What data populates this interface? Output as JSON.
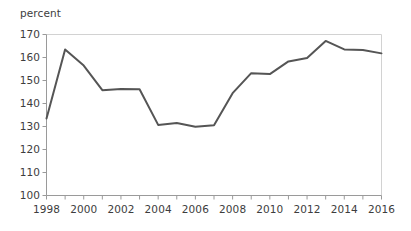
{
  "chart_data": {
    "type": "line",
    "title": "",
    "subtitle": "",
    "xlabel": "",
    "ylabel": "percent",
    "unit_label": "percent",
    "x": [
      1998,
      1999,
      2000,
      2001,
      2002,
      2003,
      2004,
      2005,
      2006,
      2007,
      2008,
      2009,
      2010,
      2011,
      2012,
      2013,
      2014,
      2015,
      2016
    ],
    "values": [
      133.5,
      163.5,
      156.5,
      145.8,
      146.3,
      146.2,
      130.7,
      131.5,
      129.9,
      130.5,
      144.5,
      153.2,
      152.8,
      158.3,
      159.8,
      167.2,
      163.5,
      163.3,
      161.8
    ],
    "series": [
      {
        "name": "percent",
        "values": [
          133.5,
          163.5,
          156.5,
          145.8,
          146.3,
          146.2,
          130.7,
          131.5,
          129.9,
          130.5,
          144.5,
          153.2,
          152.8,
          158.3,
          159.8,
          167.2,
          163.5,
          163.3,
          161.8
        ]
      }
    ],
    "ylim": [
      100,
      170
    ],
    "ystep": 10,
    "ytick_labels": [
      "170",
      "160",
      "150",
      "140",
      "130",
      "120",
      "110",
      "100"
    ],
    "xlim": [
      1998,
      2016
    ],
    "xtick_labels": [
      "1998",
      "2000",
      "2002",
      "2004",
      "2006",
      "2008",
      "2010",
      "2012",
      "2014",
      "2016"
    ],
    "xtick_values": [
      1998,
      2000,
      2002,
      2004,
      2006,
      2008,
      2010,
      2012,
      2014,
      2016
    ],
    "xminor_tick_values": [
      1998,
      1999,
      2000,
      2001,
      2002,
      2003,
      2004,
      2005,
      2006,
      2007,
      2008,
      2009,
      2010,
      2011,
      2012,
      2013,
      2014,
      2015,
      2016
    ],
    "grid": false,
    "legend": "none",
    "line_color": "#555555",
    "axis_color": "#9a9a9a",
    "text_color": "#3d3d3d",
    "background_color": "#ffffff"
  }
}
